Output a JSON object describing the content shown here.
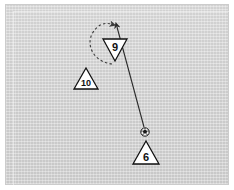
{
  "scene": {
    "title": "Soccer tactics board",
    "surface_color": "#d4d4d4",
    "border_color": "#cccccc",
    "ink_color": "#111111",
    "marker_fill": "#ffffff"
  },
  "players": [
    {
      "id": "player-9",
      "number": "9",
      "shape": "triangle-down",
      "x": 112,
      "y": 48,
      "size": 18
    },
    {
      "id": "player-10",
      "number": "10",
      "shape": "triangle-up",
      "x": 86,
      "y": 80,
      "size": 18
    },
    {
      "id": "player-6",
      "number": "6",
      "shape": "triangle-up",
      "x": 146,
      "y": 153,
      "size": 20
    }
  ],
  "ball": {
    "id": "ball",
    "label": "soccer-ball",
    "x": 145,
    "y": 132,
    "radius": 4
  },
  "pass": {
    "id": "pass-6-to-9",
    "style": "solid",
    "from_label": "6",
    "to_label": "9",
    "start_x": 144,
    "start_y": 127,
    "end_x": 117,
    "end_y": 27,
    "color": "#2a2a2a"
  },
  "run": {
    "id": "run-9",
    "style": "dashed",
    "player_label": "9",
    "color": "#3a3a3a",
    "path": "M 112,64 C 94,62 86,46 92,34 C 97,25 104,22 111,24",
    "arrow_x": 112,
    "arrow_y": 24
  },
  "legend": {
    "solid_line_meaning": "pass",
    "dashed_line_meaning": "player run",
    "triangle_up_meaning": "attacking player",
    "triangle_down_meaning": "target player"
  }
}
